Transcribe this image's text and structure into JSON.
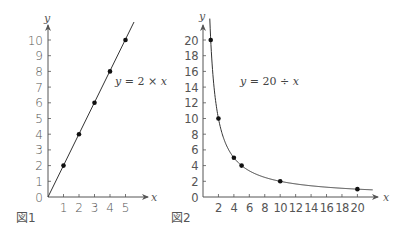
{
  "chart_data": [
    {
      "type": "line",
      "caption": "図1",
      "equation": {
        "lhs": "y",
        "eq": " = 2 × ",
        "rhs": "x"
      },
      "xlabel": "x",
      "ylabel": "y",
      "x_ticks": [
        "1",
        "2",
        "3",
        "4",
        "5"
      ],
      "y_ticks": [
        "0",
        "1",
        "2",
        "3",
        "4",
        "5",
        "6",
        "7",
        "8",
        "9",
        "10"
      ],
      "origin_label": "0",
      "xlim": [
        0,
        5.8
      ],
      "ylim": [
        0,
        10.8
      ],
      "points": [
        {
          "x": 1,
          "y": 2
        },
        {
          "x": 2,
          "y": 4
        },
        {
          "x": 3,
          "y": 6
        },
        {
          "x": 4,
          "y": 8
        },
        {
          "x": 5,
          "y": 10
        }
      ],
      "line": {
        "from": [
          0,
          0
        ],
        "to": [
          5.6,
          11.2
        ]
      },
      "grid": false
    },
    {
      "type": "line",
      "caption": "図2",
      "equation": {
        "lhs": "y",
        "eq": " = 20 ÷ ",
        "rhs": "x"
      },
      "xlabel": "x",
      "ylabel": "y",
      "x_ticks": [
        "2",
        "4",
        "6",
        "8",
        "10",
        "12",
        "14",
        "16",
        "18",
        "20"
      ],
      "y_ticks": [
        "0",
        "2",
        "4",
        "6",
        "8",
        "10",
        "12",
        "14",
        "16",
        "18",
        "20"
      ],
      "origin_label": "0",
      "xlim": [
        0,
        22
      ],
      "ylim": [
        0,
        21.5
      ],
      "points": [
        {
          "x": 1,
          "y": 20
        },
        {
          "x": 2,
          "y": 10
        },
        {
          "x": 4,
          "y": 5
        },
        {
          "x": 5,
          "y": 4
        },
        {
          "x": 10,
          "y": 2
        },
        {
          "x": 20,
          "y": 1
        }
      ],
      "curve": "y = 20 / x, x from 0.9 to 22",
      "grid": false
    }
  ]
}
